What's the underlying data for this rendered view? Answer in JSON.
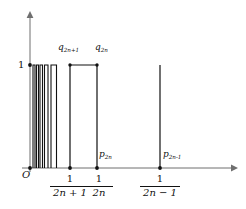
{
  "figure": {
    "type": "step-function-diagram",
    "background_color": "#ffffff",
    "stroke_color": "#111111"
  },
  "axes": {
    "y_axis": {
      "label_top": "1",
      "arrow": "up",
      "x_px": 30,
      "top_px": 12,
      "bottom_px": 168
    },
    "x_axis": {
      "arrow": "right",
      "y_px": 168,
      "left_px": 22,
      "right_px": 236
    },
    "origin_label": "O"
  },
  "height_level": {
    "value": "1",
    "y_px": 65
  },
  "bars": [
    {
      "name": "narrow-bar-1",
      "x0": 33.0,
      "x1": 35.0,
      "top": 65,
      "bottom": 168
    },
    {
      "name": "narrow-bar-2",
      "x0": 36.5,
      "x1": 38.5,
      "top": 65,
      "bottom": 168
    },
    {
      "name": "narrow-bar-3",
      "x0": 40.0,
      "x1": 42.5,
      "top": 65,
      "bottom": 168
    },
    {
      "name": "narrow-bar-4",
      "x0": 44.5,
      "x1": 48.0,
      "top": 65,
      "bottom": 168
    },
    {
      "name": "narrow-bar-5",
      "x0": 51.0,
      "x1": 56.5,
      "top": 65,
      "bottom": 168
    },
    {
      "name": "wide-bar-q2n",
      "x0": 70.0,
      "x1": 97.0,
      "top": 65,
      "bottom": 168
    }
  ],
  "spikes": [
    {
      "name": "spike-p2n-1",
      "x": 160.0,
      "top": 65,
      "bottom": 168
    }
  ],
  "axis_points": [
    {
      "name": "origin-dot",
      "x": 30.0,
      "y": 168
    },
    {
      "name": "dot-one-over-2n-plus-1",
      "x": 70.0,
      "y": 168
    },
    {
      "name": "dot-one-over-2n",
      "x": 97.0,
      "y": 168
    },
    {
      "name": "dot-one-over-2n-minus-1",
      "x": 160.0,
      "y": 168
    },
    {
      "name": "dot-height-one",
      "x": 30.0,
      "y": 65
    }
  ],
  "labels": {
    "q_left": {
      "base": "q",
      "sub": "2n+1",
      "x_px": 58,
      "y_px": 43
    },
    "q_right": {
      "base": "q",
      "sub": "2n",
      "x_px": 95,
      "y_px": 43
    },
    "p_left": {
      "base": "p",
      "sub": "2n",
      "x_px": 99,
      "y_px": 150
    },
    "p_right": {
      "base": "p",
      "sub": "2n-1",
      "x_px": 163,
      "y_px": 150
    }
  },
  "tick_fractions": [
    {
      "name": "frac-one-over-2n-plus-1",
      "numerator": "1",
      "denominator_parts": [
        "2",
        "n",
        "+",
        "1"
      ],
      "denominator_text": "2n + 1",
      "center_x_px": 70,
      "top_px": 174
    },
    {
      "name": "frac-one-over-2n",
      "numerator": "1",
      "denominator_parts": [
        "2",
        "n"
      ],
      "denominator_text": "2n",
      "center_x_px": 99,
      "top_px": 174
    },
    {
      "name": "frac-one-over-2n-minus-1",
      "numerator": "1",
      "denominator_parts": [
        "2",
        "n",
        "−",
        "1"
      ],
      "denominator_text": "2n − 1",
      "center_x_px": 160,
      "top_px": 174
    }
  ]
}
